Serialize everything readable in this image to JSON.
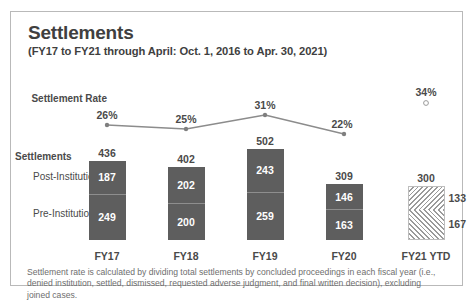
{
  "header": {
    "title": "Settlements",
    "subtitle": "(FY17 to FY21 through April: Oct. 1, 2016 to Apr. 30, 2021)"
  },
  "row_labels": {
    "settlement_rate": "Settlement Rate",
    "settlements": "Settlements",
    "post_institution": "Post-Institution",
    "pre_institution": "Pre-Institution"
  },
  "footnote": "Settlement rate is calculated by dividing total settlements by concluded proceedings in each fiscal year (i.e., denied institution, settled, dismissed, requested adverse judgment, and final written decision), excluding joined cases.",
  "colors": {
    "bar_fill": "#5e5e5e",
    "bar_label": "#ffffff",
    "line": "#8c8c8c",
    "text": "#4a4a4a",
    "border": "#b9b9b9",
    "hatch": "#9a9a9a"
  },
  "chart_data": {
    "type": "bar",
    "title": "Settlements",
    "subtitle": "(FY17 to FY21 through April: Oct. 1, 2016 to Apr. 30, 2021)",
    "xlabel": "",
    "ylabel": "",
    "grid": false,
    "legend": false,
    "categories": [
      "FY17",
      "FY18",
      "FY19",
      "FY20",
      "FY21 YTD"
    ],
    "totals": [
      436,
      402,
      502,
      309,
      300
    ],
    "stacked": true,
    "series": [
      {
        "name": "Post-Institution",
        "values": [
          187,
          202,
          243,
          146,
          133
        ],
        "stack_position": "top"
      },
      {
        "name": "Pre-Institution",
        "values": [
          249,
          200,
          259,
          163,
          167
        ],
        "stack_position": "bottom"
      }
    ],
    "overlay_line": {
      "name": "Settlement Rate",
      "values": [
        26,
        25,
        31,
        22,
        34
      ],
      "labels": [
        "26%",
        "25%",
        "31%",
        "22%",
        "34%"
      ],
      "connected_through": 4,
      "last_point_style": "hollow-marker-unconnected"
    },
    "projected_category": "FY21 YTD",
    "projected_style": "hatched"
  },
  "bars": [
    {
      "category": "FY17",
      "total": "436",
      "top_value": "187",
      "bottom_value": "249",
      "style": "solid"
    },
    {
      "category": "FY18",
      "total": "402",
      "top_value": "202",
      "bottom_value": "200",
      "style": "solid"
    },
    {
      "category": "FY19",
      "total": "502",
      "top_value": "243",
      "bottom_value": "259",
      "style": "solid"
    },
    {
      "category": "FY20",
      "total": "309",
      "top_value": "146",
      "bottom_value": "163",
      "style": "solid"
    },
    {
      "category": "FY21 YTD",
      "total": "300",
      "top_value": "133",
      "bottom_value": "167",
      "style": "hatched"
    }
  ],
  "rate_points": [
    {
      "category": "FY17",
      "label": "26%"
    },
    {
      "category": "FY18",
      "label": "25%"
    },
    {
      "category": "FY19",
      "label": "31%"
    },
    {
      "category": "FY20",
      "label": "22%"
    },
    {
      "category": "FY21 YTD",
      "label": "34%"
    }
  ],
  "axis_ticks": [
    "FY17",
    "FY18",
    "FY19",
    "FY20",
    "FY21 YTD"
  ]
}
